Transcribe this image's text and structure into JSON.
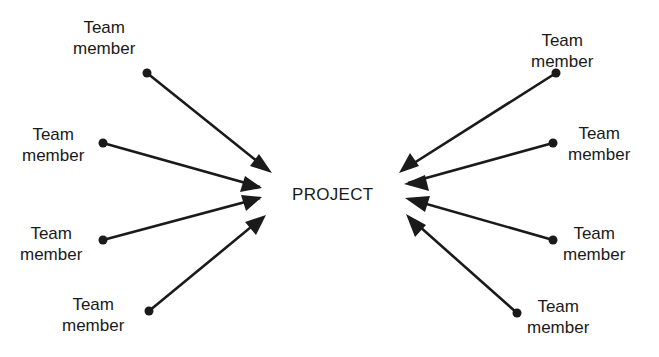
{
  "diagram": {
    "center_label": "PROJECT",
    "colors": {
      "line": "#1a1a1a",
      "background": "#ffffff"
    },
    "nodes": [
      {
        "id": "left-1",
        "line1": "Team",
        "line2": "member",
        "side": "left"
      },
      {
        "id": "left-2",
        "line1": "Team",
        "line2": "member",
        "side": "left"
      },
      {
        "id": "left-3",
        "line1": "Team",
        "line2": "member",
        "side": "left"
      },
      {
        "id": "left-4",
        "line1": "Team",
        "line2": "member",
        "side": "left"
      },
      {
        "id": "right-1",
        "line1": "Team",
        "line2": "member",
        "side": "right"
      },
      {
        "id": "right-2",
        "line1": "Team",
        "line2": "member",
        "side": "right"
      },
      {
        "id": "right-3",
        "line1": "Team",
        "line2": "member",
        "side": "right"
      },
      {
        "id": "right-4",
        "line1": "Team",
        "line2": "member",
        "side": "right"
      }
    ],
    "edges": [
      {
        "from": "left-1",
        "to": "PROJECT"
      },
      {
        "from": "left-2",
        "to": "PROJECT"
      },
      {
        "from": "left-3",
        "to": "PROJECT"
      },
      {
        "from": "left-4",
        "to": "PROJECT"
      },
      {
        "from": "right-1",
        "to": "PROJECT"
      },
      {
        "from": "right-2",
        "to": "PROJECT"
      },
      {
        "from": "right-3",
        "to": "PROJECT"
      },
      {
        "from": "right-4",
        "to": "PROJECT"
      }
    ]
  }
}
